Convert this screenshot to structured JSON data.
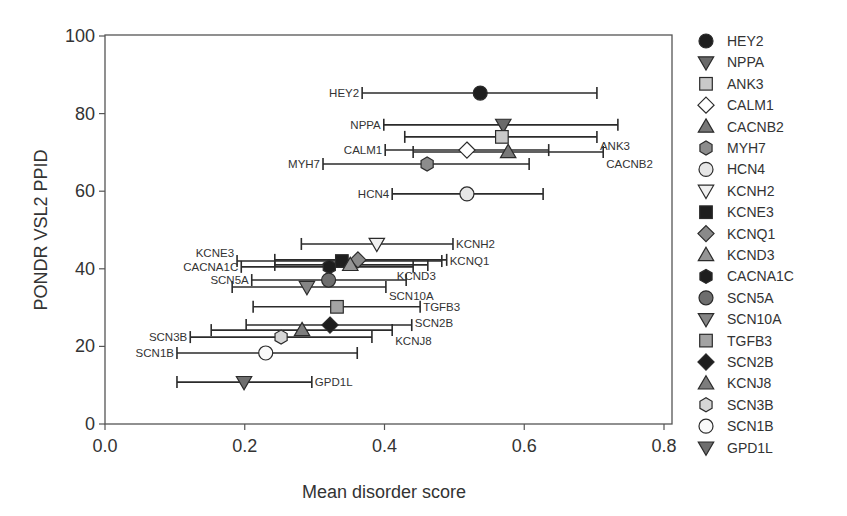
{
  "chart_data": {
    "type": "scatter",
    "subtype": "scatter-with-horizontal-error-bars",
    "title": "",
    "xlabel": "Mean disorder score",
    "ylabel": "PONDR VSL2 PPID",
    "xlim": [
      0.0,
      0.8
    ],
    "ylim": [
      0,
      100
    ],
    "xticks": [
      "0.0",
      "0.2",
      "0.4",
      "0.6",
      "0.8"
    ],
    "yticks": [
      "0",
      "20",
      "40",
      "60",
      "80",
      "100"
    ],
    "grid": false,
    "legend_position": "right",
    "series": [
      {
        "name": "HEY2",
        "marker": "circle",
        "color": "#1e1e1e",
        "x": 0.537,
        "y": 85.3,
        "x_low": 0.368,
        "x_high": 0.704,
        "label_side": "left"
      },
      {
        "name": "NPPA",
        "marker": "triangle-down",
        "color": "#6a6a6a",
        "x": 0.57,
        "y": 77.1,
        "x_low": 0.399,
        "x_high": 0.734,
        "label_side": "left"
      },
      {
        "name": "ANK3",
        "marker": "square",
        "color": "#c9c9c9",
        "x": 0.568,
        "y": 74.0,
        "x_low": 0.429,
        "x_high": 0.704,
        "label_side": "right"
      },
      {
        "name": "CALM1",
        "marker": "diamond",
        "color": "#ffffff",
        "x": 0.518,
        "y": 70.6,
        "x_low": 0.401,
        "x_high": 0.635,
        "label_side": "left"
      },
      {
        "name": "CACNB2",
        "marker": "triangle-up",
        "color": "#787878",
        "x": 0.577,
        "y": 70.1,
        "x_low": 0.441,
        "x_high": 0.713,
        "label_side": "right"
      },
      {
        "name": "MYH7",
        "marker": "hexagon",
        "color": "#8c8c8c",
        "x": 0.461,
        "y": 67.0,
        "x_low": 0.312,
        "x_high": 0.607,
        "label_side": "left"
      },
      {
        "name": "HCN4",
        "marker": "circle",
        "color": "#e6e6e6",
        "x": 0.518,
        "y": 59.3,
        "x_low": 0.411,
        "x_high": 0.627,
        "label_side": "left"
      },
      {
        "name": "KCNH2",
        "marker": "triangle-down",
        "color": "#f0f0f0",
        "x": 0.389,
        "y": 46.4,
        "x_low": 0.281,
        "x_high": 0.498,
        "label_side": "right"
      },
      {
        "name": "KCNE3",
        "marker": "square",
        "color": "#1e1e1e",
        "x": 0.339,
        "y": 42.0,
        "x_low": 0.189,
        "x_high": 0.482,
        "label_side": "left"
      },
      {
        "name": "KCNQ1",
        "marker": "diamond",
        "color": "#8a8a8a",
        "x": 0.362,
        "y": 42.3,
        "x_low": 0.243,
        "x_high": 0.489,
        "label_side": "right"
      },
      {
        "name": "KCND3",
        "marker": "triangle-up",
        "color": "#959595",
        "x": 0.351,
        "y": 41.0,
        "x_low": 0.243,
        "x_high": 0.462,
        "label_side": "right"
      },
      {
        "name": "CACNA1C",
        "marker": "hexagon",
        "color": "#1e1e1e",
        "x": 0.321,
        "y": 40.5,
        "x_low": 0.195,
        "x_high": 0.441,
        "label_side": "left"
      },
      {
        "name": "SCN5A",
        "marker": "circle",
        "color": "#6e6e6e",
        "x": 0.32,
        "y": 37.1,
        "x_low": 0.21,
        "x_high": 0.431,
        "label_side": "left"
      },
      {
        "name": "SCN10A",
        "marker": "triangle-down",
        "color": "#858585",
        "x": 0.289,
        "y": 35.3,
        "x_low": 0.182,
        "x_high": 0.402,
        "label_side": "right"
      },
      {
        "name": "TGFB3",
        "marker": "square",
        "color": "#a3a3a3",
        "x": 0.332,
        "y": 30.2,
        "x_low": 0.212,
        "x_high": 0.451,
        "label_side": "right"
      },
      {
        "name": "SCN2B",
        "marker": "diamond",
        "color": "#1e1e1e",
        "x": 0.322,
        "y": 25.5,
        "x_low": 0.202,
        "x_high": 0.439,
        "label_side": "right"
      },
      {
        "name": "KCNJ8",
        "marker": "triangle-up",
        "color": "#7d7d7d",
        "x": 0.282,
        "y": 24.2,
        "x_low": 0.152,
        "x_high": 0.411,
        "label_side": "right"
      },
      {
        "name": "SCN3B",
        "marker": "hexagon",
        "color": "#d6d6d6",
        "x": 0.252,
        "y": 22.4,
        "x_low": 0.122,
        "x_high": 0.382,
        "label_side": "left"
      },
      {
        "name": "SCN1B",
        "marker": "circle",
        "color": "#fafafa",
        "x": 0.23,
        "y": 18.3,
        "x_low": 0.103,
        "x_high": 0.361,
        "label_side": "left"
      },
      {
        "name": "GPD1L",
        "marker": "triangle-down",
        "color": "#6e6e6e",
        "x": 0.199,
        "y": 10.8,
        "x_low": 0.103,
        "x_high": 0.296,
        "label_side": "right"
      }
    ]
  }
}
